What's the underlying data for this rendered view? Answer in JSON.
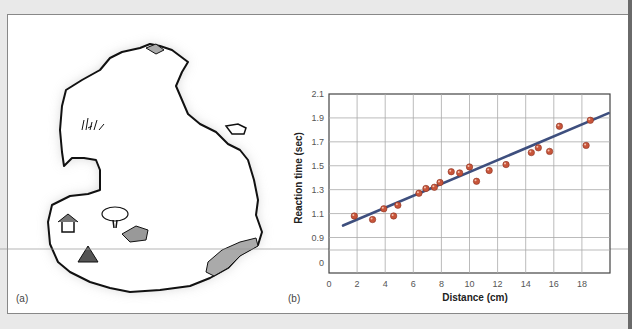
{
  "figure": {
    "panel_a_label": "(a)",
    "panel_b_label": "(b)",
    "map": {
      "description": "Hand-drawn island map with illustrated features",
      "features": [
        "grass-tuft",
        "tree",
        "hut",
        "hut-2",
        "pond",
        "shaded-peninsula",
        "small-islet"
      ]
    }
  },
  "chart_data": {
    "type": "scatter",
    "title": "",
    "xlabel": "Distance (cm)",
    "ylabel": "Reaction time (sec)",
    "xlim": [
      0,
      20
    ],
    "ylim_labels": [
      "0",
      "0.9",
      "1.1",
      "1.3",
      "1.5",
      "1.7",
      "1.9",
      "2.1"
    ],
    "x_ticks": [
      "0",
      "2",
      "4",
      "6",
      "8",
      "10",
      "12",
      "14",
      "16",
      "18"
    ],
    "grid": true,
    "axis_break": "y axis jumps from 0 to 0.9",
    "series": [
      {
        "name": "observations",
        "color": "#c8553a",
        "points": [
          {
            "x": 1.8,
            "y": 1.08
          },
          {
            "x": 3.1,
            "y": 1.05
          },
          {
            "x": 3.9,
            "y": 1.14
          },
          {
            "x": 4.6,
            "y": 1.08
          },
          {
            "x": 4.9,
            "y": 1.17
          },
          {
            "x": 6.4,
            "y": 1.27
          },
          {
            "x": 6.9,
            "y": 1.31
          },
          {
            "x": 7.5,
            "y": 1.32
          },
          {
            "x": 7.9,
            "y": 1.36
          },
          {
            "x": 8.7,
            "y": 1.45
          },
          {
            "x": 9.3,
            "y": 1.44
          },
          {
            "x": 10.0,
            "y": 1.49
          },
          {
            "x": 10.5,
            "y": 1.37
          },
          {
            "x": 11.4,
            "y": 1.46
          },
          {
            "x": 12.6,
            "y": 1.51
          },
          {
            "x": 14.4,
            "y": 1.61
          },
          {
            "x": 14.9,
            "y": 1.65
          },
          {
            "x": 15.7,
            "y": 1.62
          },
          {
            "x": 16.4,
            "y": 1.83
          },
          {
            "x": 18.3,
            "y": 1.67
          },
          {
            "x": 18.6,
            "y": 1.88
          }
        ]
      },
      {
        "name": "regression-line",
        "type": "line",
        "color": "#3e4f7e",
        "points": [
          {
            "x": 1.0,
            "y": 1.0
          },
          {
            "x": 19.9,
            "y": 1.94
          }
        ]
      }
    ]
  }
}
